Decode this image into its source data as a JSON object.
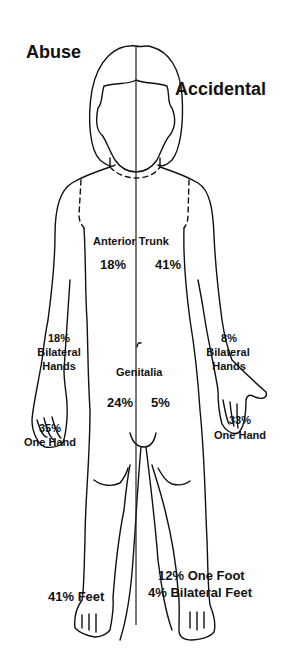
{
  "titles": {
    "left": "Abuse",
    "right": "Accidental"
  },
  "regions": {
    "anterior_trunk": {
      "label": "Anterior Trunk",
      "abuse": "18%",
      "accidental": "41%"
    },
    "bilateral_hands": {
      "label_line1": "Bilateral",
      "label_line2": "Hands",
      "abuse": "18%",
      "accidental": "8%"
    },
    "one_hand": {
      "label": "One Hand",
      "abuse": "35%",
      "accidental": "33%"
    },
    "genitalia": {
      "label": "Genitalia",
      "abuse": "24%",
      "accidental": "5%"
    },
    "feet": {
      "abuse": "41% Feet",
      "accidental_one_foot": "12% One Foot",
      "accidental_bilateral": "4% Bilateral Feet"
    }
  },
  "colors": {
    "line": "#111111",
    "background": "#ffffff"
  }
}
